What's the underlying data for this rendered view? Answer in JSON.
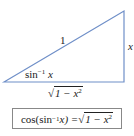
{
  "diagram": {
    "type": "right-triangle",
    "line_color": "#6f8fc8",
    "hypotenuse_label": "1",
    "opposite_label": "x",
    "angle_label": {
      "func": "sin",
      "exp": "−1",
      "arg": "x"
    },
    "adjacent_label": {
      "radicand": "1 − x",
      "exp": "2"
    }
  },
  "identity": {
    "lhs": "cos(sin",
    "lhs_exp": "−1",
    "lhs_arg": " x) = ",
    "rhs_radicand": "1 − x",
    "rhs_exp": "2"
  }
}
